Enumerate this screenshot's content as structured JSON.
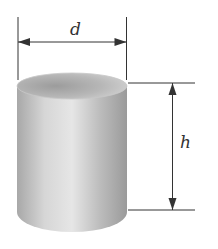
{
  "diagram": {
    "type": "cylinder-dimensions",
    "shape": "cylinder",
    "labels": {
      "diameter": "d",
      "height": "h"
    },
    "colors": {
      "line": "#333333",
      "cylinder_light": "#e8e8e8",
      "cylinder_dark": "#9a9a9a",
      "top_ellipse": "#b5b5b5"
    }
  }
}
